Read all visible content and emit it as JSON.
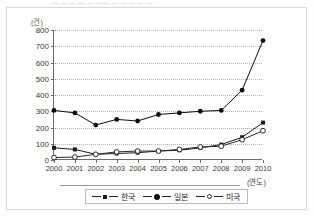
{
  "top_remnant": "ㅡ ㅡ  ㅡ   ㅡ ㅡ ㅡㅡ ㅡ  ㅡ ㅡ  ㅡ ㅡ",
  "chart_data": {
    "type": "line",
    "title": "",
    "xlabel": "(연도)",
    "ylabel": "(건)",
    "unit_y": "(건)",
    "unit_x": "(연도)",
    "categories": [
      "2000",
      "2001",
      "2002",
      "2003",
      "2004",
      "2005",
      "2006",
      "2007",
      "2008",
      "2009",
      "2010"
    ],
    "x": [
      2000,
      2001,
      2002,
      2003,
      2004,
      2005,
      2006,
      2007,
      2008,
      2009,
      2010
    ],
    "ylim": [
      0,
      800
    ],
    "yticks": [
      0,
      100,
      200,
      300,
      400,
      500,
      600,
      700,
      800
    ],
    "ytick_labels": [
      "0",
      "100",
      "200",
      "300",
      "400",
      "500",
      "600",
      "700",
      "800"
    ],
    "grid": true,
    "legend_position": "bottom",
    "series": [
      {
        "name": "한국",
        "marker": "filled-square",
        "color": "#1a1a1a",
        "values": [
          75,
          65,
          35,
          40,
          45,
          55,
          60,
          75,
          95,
          140,
          230
        ]
      },
      {
        "name": "일본",
        "marker": "filled-circle",
        "color": "#0d0d0d",
        "values": [
          305,
          290,
          215,
          250,
          240,
          280,
          290,
          300,
          305,
          430,
          735
        ]
      },
      {
        "name": "미국",
        "marker": "open-circle",
        "color": "#2a2a2a",
        "values": [
          15,
          18,
          35,
          50,
          55,
          55,
          65,
          80,
          85,
          125,
          180
        ]
      }
    ]
  },
  "legend": {
    "items": [
      {
        "label": "한국",
        "marker": "filled-square"
      },
      {
        "label": "일본",
        "marker": "filled-circle"
      },
      {
        "label": "미국",
        "marker": "open-circle"
      }
    ]
  }
}
